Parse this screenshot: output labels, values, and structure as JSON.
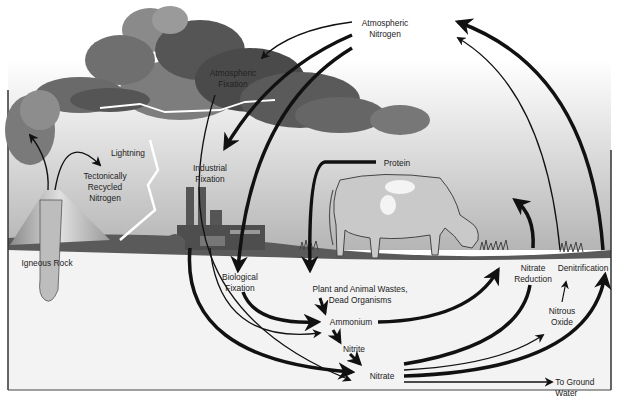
{
  "diagram": {
    "type": "process-cycle",
    "colors": {
      "sky_top": "#ffffff",
      "sky_bottom": "#bdbdbd",
      "cloud_dark": "#4a4a4a",
      "cloud_light": "#9a9a9a",
      "ground": "#5e5e5e",
      "soil": "#f2f2f2",
      "arrow": "#111111",
      "lightning": "#ffffff"
    },
    "labels": {
      "atmospheric_nitrogen": [
        "Atmospheric",
        "Nitrogen"
      ],
      "atmospheric_fixation": [
        "Atmospheric",
        "Fixation"
      ],
      "lightning": "Lightning",
      "tectonically_recycled_nitrogen": [
        "Tectonically",
        "Recycled",
        "Nitrogen"
      ],
      "industrial_fixation": [
        "Industrial",
        "Fixation"
      ],
      "igneous_rock": "Igneous Rock",
      "protein": "Protein",
      "biological_fixation": [
        "Biological",
        "Fixation"
      ],
      "plant_animal_wastes": [
        "Plant and Animal Wastes,",
        "Dead Organisms"
      ],
      "ammonium": "Ammonium",
      "nitrite": "Nitrite",
      "nitrate": "Nitrate",
      "nitrate_reduction": [
        "Nitrate",
        "Reduction"
      ],
      "denitrification": "Denitrification",
      "nitrous_oxide": [
        "Nitrous",
        "Oxide"
      ],
      "to_ground_water": [
        "To Ground",
        "Water"
      ]
    },
    "flows": [
      {
        "from": "Atmospheric Nitrogen",
        "to": "Atmospheric Fixation"
      },
      {
        "from": "Atmospheric Nitrogen",
        "to": "Industrial Fixation"
      },
      {
        "from": "Atmospheric Nitrogen",
        "to": "Biological Fixation"
      },
      {
        "from": "Lightning / Atmospheric Fixation",
        "to": "Nitrate"
      },
      {
        "from": "Industrial Fixation",
        "to": "Ammonium"
      },
      {
        "from": "Industrial Fixation",
        "to": "Nitrate"
      },
      {
        "from": "Biological Fixation",
        "to": "Ammonium"
      },
      {
        "from": "Protein",
        "to": "Plant and Animal Wastes, Dead Organisms"
      },
      {
        "from": "Plant and Animal Wastes, Dead Organisms",
        "to": "Ammonium"
      },
      {
        "from": "Ammonium",
        "to": "Nitrite"
      },
      {
        "from": "Nitrite",
        "to": "Nitrate"
      },
      {
        "from": "Ammonium",
        "to": "Nitrate Reduction"
      },
      {
        "from": "Nitrate",
        "to": "Nitrate Reduction"
      },
      {
        "from": "Nitrate",
        "to": "Nitrous Oxide"
      },
      {
        "from": "Nitrate",
        "to": "Denitrification"
      },
      {
        "from": "Nitrate",
        "to": "To Ground Water"
      },
      {
        "from": "Nitrous Oxide",
        "to": "Denitrification"
      },
      {
        "from": "Denitrification",
        "to": "Atmospheric Nitrogen"
      },
      {
        "from": "Nitrate Reduction",
        "to": "Atmospheric Nitrogen"
      },
      {
        "from": "Igneous Rock",
        "to": "Tectonically Recycled Nitrogen"
      }
    ]
  }
}
